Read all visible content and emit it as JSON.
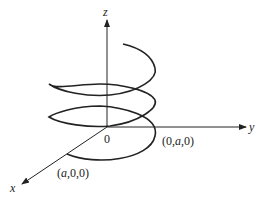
{
  "diagram": {
    "type": "3d-helix-axes",
    "axes": {
      "z": {
        "label": "z"
      },
      "y": {
        "label": "y"
      },
      "x": {
        "label": "x"
      }
    },
    "origin_label": "0",
    "points": [
      {
        "label_parts": [
          "(",
          "0",
          ",",
          "a",
          ",",
          "0",
          ")"
        ],
        "name": "point-0a0"
      },
      {
        "label_parts": [
          "(",
          "a",
          ",",
          "0",
          ",",
          "0",
          ")"
        ],
        "name": "point-a00"
      }
    ],
    "colors": {
      "stroke": "#222222",
      "background": "#ffffff"
    }
  }
}
